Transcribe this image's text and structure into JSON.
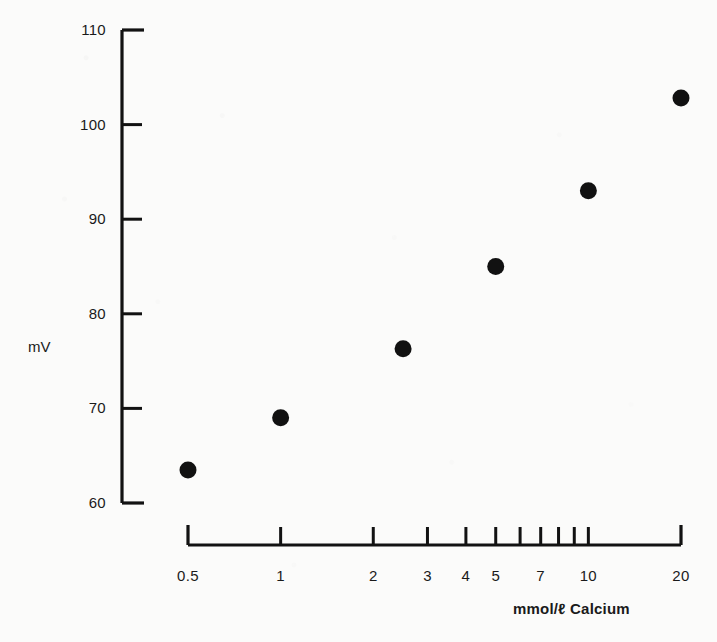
{
  "chart_data": {
    "type": "scatter",
    "title": "",
    "subtitle": "",
    "xlabel": "mmol/ℓ  Calcium",
    "ylabel": "mV",
    "x_scale": "log",
    "y_scale": "linear",
    "xlim": [
      0.5,
      20
    ],
    "ylim": [
      60,
      110
    ],
    "grid": false,
    "legend": null,
    "x_ticks_labeled": [
      "0.5",
      "1",
      "2",
      "3",
      "4",
      "5",
      "7",
      "10",
      "20"
    ],
    "x_tick_values_labeled": [
      0.5,
      1,
      2,
      3,
      4,
      5,
      7,
      10,
      20
    ],
    "x_tick_values_unlabeled": [
      6,
      8,
      9
    ],
    "y_ticks": [
      "60",
      "70",
      "80",
      "90",
      "100",
      "110"
    ],
    "y_tick_values": [
      60,
      70,
      80,
      90,
      100,
      110
    ],
    "series": [
      {
        "name": "Calcium electrode response",
        "marker": "filled-circle",
        "color": "#111111",
        "points": [
          {
            "x": 0.5,
            "y": 63.5
          },
          {
            "x": 1.0,
            "y": 69.0
          },
          {
            "x": 2.5,
            "y": 76.3
          },
          {
            "x": 5.0,
            "y": 85.0
          },
          {
            "x": 10.0,
            "y": 93.0
          },
          {
            "x": 20.0,
            "y": 102.8
          }
        ]
      }
    ]
  },
  "axes": {
    "y_axis_title": "mV",
    "x_axis_title": "mmol/ℓ  Calcium",
    "axis_color": "#121212"
  },
  "colors": {
    "background": "#fbfbfa",
    "ink": "#121212",
    "marker": "#111111"
  }
}
